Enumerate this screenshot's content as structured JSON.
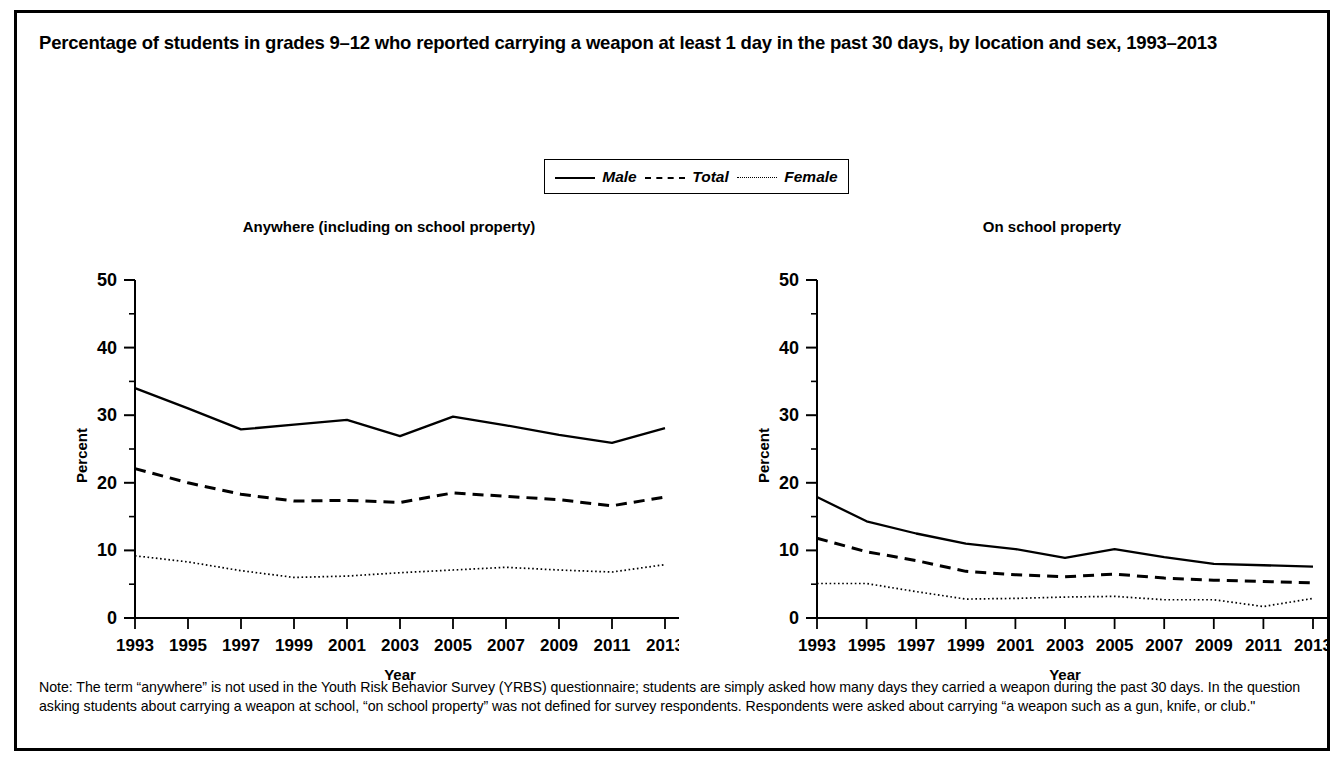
{
  "figure": {
    "title": "Percentage of students in grades 9–12 who reported carrying a weapon at least 1 day in the past 30 days, by location and sex, 1993–2013",
    "note": "Note: The term “anywhere” is not used in the Youth Risk Behavior Survey (YRBS) questionnaire; students are simply asked how many days they carried a weapon during the past 30 days. In the question asking students about carrying a weapon at school, “on school property” was not defined for survey respondents. Respondents were asked about carrying “a weapon such as a gun, knife, or club.\"",
    "colors": {
      "ink": "#000000",
      "background": "#ffffff"
    }
  },
  "legend": {
    "position": "top-center",
    "entries": [
      {
        "label": "Male",
        "style": "solid"
      },
      {
        "label": "Total",
        "style": "dashed"
      },
      {
        "label": "Female",
        "style": "dotted"
      }
    ]
  },
  "chart_data": [
    {
      "type": "line",
      "title": "Anywhere (including on school property)",
      "xlabel": "Year",
      "ylabel": "Percent",
      "x": [
        1993,
        1995,
        1997,
        1999,
        2001,
        2003,
        2005,
        2007,
        2009,
        2011,
        2013
      ],
      "xticklabels": [
        "1993",
        "1995",
        "1997",
        "1999",
        "2001",
        "2003",
        "2005",
        "2007",
        "2009",
        "2011",
        "2013"
      ],
      "ylim": [
        0,
        50
      ],
      "yticks": [
        0,
        10,
        20,
        30,
        40,
        50
      ],
      "yticklabels": [
        "0",
        "10",
        "20",
        "30",
        "40",
        "50"
      ],
      "grid": false,
      "series": [
        {
          "name": "Male",
          "style": "solid",
          "values": [
            34.0,
            31.0,
            27.9,
            28.6,
            29.3,
            26.9,
            29.8,
            28.5,
            27.1,
            25.9,
            28.1
          ]
        },
        {
          "name": "Total",
          "style": "dashed",
          "values": [
            22.1,
            20.0,
            18.3,
            17.3,
            17.4,
            17.1,
            18.5,
            18.0,
            17.5,
            16.6,
            17.9
          ]
        },
        {
          "name": "Female",
          "style": "dotted",
          "values": [
            9.2,
            8.3,
            7.0,
            6.0,
            6.2,
            6.7,
            7.1,
            7.5,
            7.1,
            6.8,
            7.9
          ]
        }
      ]
    },
    {
      "type": "line",
      "title": "On school property",
      "xlabel": "Year",
      "ylabel": "Percent",
      "x": [
        1993,
        1995,
        1997,
        1999,
        2001,
        2003,
        2005,
        2007,
        2009,
        2011,
        2013
      ],
      "xticklabels": [
        "1993",
        "1995",
        "1997",
        "1999",
        "2001",
        "2003",
        "2005",
        "2007",
        "2009",
        "2011",
        "2013"
      ],
      "ylim": [
        0,
        50
      ],
      "yticks": [
        0,
        10,
        20,
        30,
        40,
        50
      ],
      "yticklabels": [
        "0",
        "10",
        "20",
        "30",
        "40",
        "50"
      ],
      "grid": false,
      "series": [
        {
          "name": "Male",
          "style": "solid",
          "values": [
            17.9,
            14.3,
            12.5,
            11.0,
            10.2,
            8.9,
            10.2,
            9.0,
            8.0,
            7.8,
            7.6
          ]
        },
        {
          "name": "Total",
          "style": "dashed",
          "values": [
            11.8,
            9.8,
            8.5,
            6.9,
            6.4,
            6.1,
            6.5,
            5.9,
            5.6,
            5.4,
            5.2
          ]
        },
        {
          "name": "Female",
          "style": "dotted",
          "values": [
            5.1,
            5.1,
            3.9,
            2.8,
            2.9,
            3.1,
            3.2,
            2.7,
            2.7,
            1.7,
            2.9
          ]
        }
      ]
    }
  ]
}
